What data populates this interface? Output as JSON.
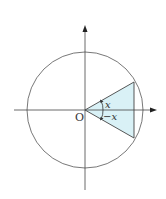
{
  "diagram": {
    "origin_label": "O",
    "angle_upper_label": "x",
    "angle_lower_label": "−x",
    "colors": {
      "stroke": "#444444",
      "fill": "#d9f1f6"
    }
  }
}
